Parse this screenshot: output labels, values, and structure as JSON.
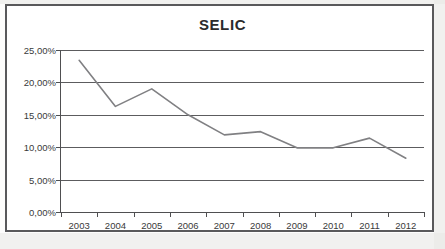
{
  "chart_data": {
    "type": "line",
    "title": "SELIC",
    "xlabel": "",
    "ylabel": "",
    "categories": [
      "2003",
      "2004",
      "2005",
      "2006",
      "2007",
      "2008",
      "2009",
      "2010",
      "2011",
      "2012"
    ],
    "values": [
      23.4,
      16.3,
      19.0,
      15.0,
      11.9,
      12.4,
      9.9,
      9.9,
      11.4,
      8.3
    ],
    "series": [
      {
        "name": "SELIC",
        "values": [
          23.4,
          16.3,
          19.0,
          15.0,
          11.9,
          12.4,
          9.9,
          9.9,
          11.4,
          8.3
        ]
      }
    ],
    "ylim": [
      0,
      25
    ],
    "y_ticks": [
      0,
      5,
      10,
      15,
      20,
      25
    ],
    "y_tick_labels": [
      "0,00%",
      "5,00%",
      "10,00%",
      "15,00%",
      "20,00%",
      "25,00%"
    ],
    "grid": true,
    "grid_axis": "y",
    "legend": false,
    "legend_position": "none",
    "markers": false,
    "value_format": "percent-comma",
    "colors": {
      "line": "#808083",
      "grid": "#5c5c5e",
      "axis": "#4f4f51",
      "title": "#2b2b2b",
      "tick_label": "#3a3a3a",
      "frame": "#59595b",
      "background": "#ffffff"
    },
    "line_width": 1.6
  }
}
